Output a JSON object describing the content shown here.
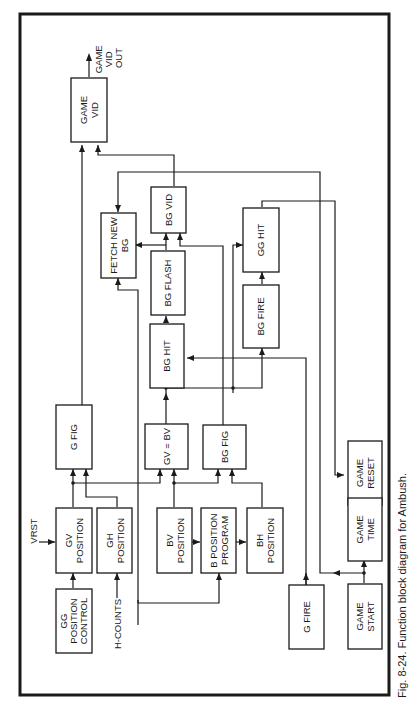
{
  "figure": {
    "caption": "Fig. 8-24. Function block diagram for Ambush.",
    "orientation": "rotated 90° counter-clockwise (landscape diagram on portrait page)"
  },
  "blocks": {
    "game_vid": [
      "GAME",
      "VID"
    ],
    "bg_vid": [
      "BG VID"
    ],
    "fetch_new_bg": [
      "FETCH NEW",
      "BG"
    ],
    "bg_flash": [
      "BG FLASH"
    ],
    "bg_hit": [
      "BG HIT"
    ],
    "gg_hit": [
      "GG  HIT"
    ],
    "bg_fire": [
      "BG FIRE"
    ],
    "g_fig": [
      "G FIG"
    ],
    "gv_eq_bv": [
      "GV = BV"
    ],
    "bg_fig": [
      "BG FIG"
    ],
    "game_reset": [
      "GAME",
      "RESET"
    ],
    "game_time": [
      "GAME",
      "TIME"
    ],
    "gv_position": [
      "GV",
      "POSITION"
    ],
    "gh_position": [
      "GH",
      "POSITION"
    ],
    "bv_position": [
      "BV",
      "POSITION"
    ],
    "b_position_program": [
      "B POSITION",
      "PROGRAM"
    ],
    "bh_position": [
      "BH",
      "POSITION"
    ],
    "gg_position_control": [
      "GG",
      "POSITION",
      "CONTROL"
    ],
    "g_fire": [
      "G FIRE"
    ],
    "game_start": [
      "GAME",
      "START"
    ]
  },
  "signals": {
    "game_vid_out": [
      "GAME",
      "VID",
      "OUT"
    ],
    "vrst": "VRST",
    "h_counts": "H-COUNTS"
  }
}
